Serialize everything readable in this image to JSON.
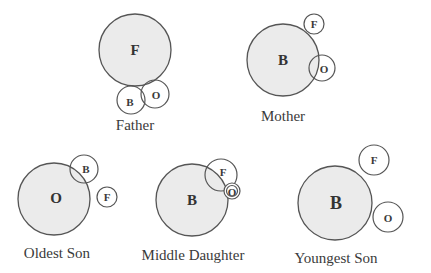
{
  "diagram": {
    "colors": {
      "fill": "#ebebeb",
      "stroke": "#555555",
      "text": "#333333"
    },
    "panels": [
      {
        "caption": "Father",
        "big": {
          "label": "F"
        },
        "others": [
          {
            "label": "B"
          },
          {
            "label": "O"
          }
        ]
      },
      {
        "caption": "Mother",
        "big": {
          "label": "B"
        },
        "others": [
          {
            "label": "F"
          },
          {
            "label": "O"
          }
        ]
      },
      {
        "caption": "Oldest Son",
        "big": {
          "label": "O"
        },
        "others": [
          {
            "label": "B"
          },
          {
            "label": "F"
          }
        ]
      },
      {
        "caption": "Middle Daughter",
        "big": {
          "label": "B"
        },
        "others": [
          {
            "label": "F"
          },
          {
            "label": "O"
          }
        ]
      },
      {
        "caption": "Youngest Son",
        "big": {
          "label": "B"
        },
        "others": [
          {
            "label": "F"
          },
          {
            "label": "O"
          }
        ]
      }
    ]
  }
}
